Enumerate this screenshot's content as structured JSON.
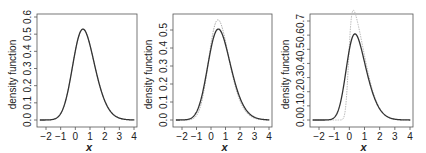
{
  "chart_data": [
    {
      "type": "line",
      "title": "",
      "xlabel": "x",
      "ylabel": "density function",
      "xlim": [
        -2.5,
        4.1
      ],
      "ylim": [
        0,
        0.6
      ],
      "x_ticks": [
        "-2",
        "-1",
        "0",
        "1",
        "2",
        "3",
        "4"
      ],
      "y_ticks": [
        "0.0",
        "0.1",
        "0.2",
        "0.3",
        "0.4",
        "0.5",
        "0.6"
      ],
      "grid": false,
      "legend": null,
      "series": [
        {
          "name": "fitted density",
          "color": "#333333",
          "style": "solid",
          "x": [
            -2.5,
            -1.5,
            -1.0,
            -0.5,
            0.0,
            0.3,
            0.5,
            0.7,
            1.0,
            1.5,
            2.0,
            2.5,
            3.0,
            4.0
          ],
          "values": [
            0.0,
            0.003,
            0.02,
            0.12,
            0.38,
            0.54,
            0.57,
            0.55,
            0.46,
            0.28,
            0.13,
            0.05,
            0.015,
            0.001
          ]
        },
        {
          "name": "true density",
          "color": "#aaaaaa",
          "style": "dotted",
          "x": [
            -2.5,
            -1.5,
            -1.0,
            -0.5,
            0.0,
            0.3,
            0.5,
            0.7,
            1.0,
            1.5,
            2.0,
            2.5,
            3.0,
            4.0
          ],
          "values": [
            0.0,
            0.003,
            0.02,
            0.12,
            0.38,
            0.54,
            0.57,
            0.55,
            0.46,
            0.28,
            0.13,
            0.05,
            0.015,
            0.001
          ]
        }
      ],
      "params": {
        "fit": {
          "loc": -0.05,
          "scale": 1.05,
          "shape": 1.6
        },
        "true": {
          "loc": -0.05,
          "scale": 1.05,
          "shape": 1.6
        },
        "ymax": 0.6
      }
    },
    {
      "type": "line",
      "title": "",
      "xlabel": "x",
      "ylabel": "density function",
      "xlim": [
        -2.5,
        4.1
      ],
      "ylim": [
        0,
        0.57
      ],
      "x_ticks": [
        "-2",
        "-1",
        "0",
        "1",
        "2",
        "3",
        "4"
      ],
      "y_ticks": [
        "0.0",
        "0.1",
        "0.2",
        "0.3",
        "0.4",
        "0.5"
      ],
      "grid": false,
      "legend": null,
      "series": [
        {
          "name": "fitted density",
          "color": "#333333",
          "style": "solid",
          "x": [
            -2.5,
            -1.5,
            -1.0,
            -0.5,
            0.0,
            0.3,
            0.5,
            0.7,
            1.0,
            1.5,
            2.0,
            2.5,
            3.0,
            4.0
          ],
          "values": [
            0.0,
            0.004,
            0.025,
            0.12,
            0.36,
            0.51,
            0.54,
            0.52,
            0.44,
            0.27,
            0.13,
            0.05,
            0.015,
            0.001
          ]
        },
        {
          "name": "true density",
          "color": "#aaaaaa",
          "style": "dotted",
          "x": [
            -2.5,
            -1.5,
            -1.0,
            -0.5,
            0.0,
            0.3,
            0.5,
            0.7,
            1.0,
            1.5,
            2.0,
            2.5,
            3.0,
            4.0
          ],
          "values": [
            0.0,
            0.003,
            0.02,
            0.11,
            0.37,
            0.54,
            0.57,
            0.54,
            0.44,
            0.26,
            0.12,
            0.045,
            0.013,
            0.001
          ]
        }
      ],
      "params": {
        "fit": {
          "loc": -0.1,
          "scale": 1.12,
          "shape": 1.7
        },
        "true": {
          "loc": -0.08,
          "scale": 1.05,
          "shape": 1.9
        },
        "ymax": 0.57
      }
    },
    {
      "type": "line",
      "title": "",
      "xlabel": "x",
      "ylabel": "density function",
      "xlim": [
        -2.5,
        4.1
      ],
      "ylim": [
        0,
        0.72
      ],
      "x_ticks": [
        "-2",
        "-1",
        "0",
        "1",
        "2",
        "3",
        "4"
      ],
      "y_ticks": [
        "0.0",
        "0.1",
        "0.2",
        "0.3",
        "0.4",
        "0.5",
        "0.6",
        "0.7"
      ],
      "grid": false,
      "legend": null,
      "series": [
        {
          "name": "fitted density",
          "color": "#333333",
          "style": "solid",
          "x": [
            -2.5,
            -1.5,
            -1.0,
            -0.5,
            0.0,
            0.3,
            0.5,
            0.7,
            1.0,
            1.5,
            2.0,
            2.5,
            3.0,
            4.0
          ],
          "values": [
            0.0,
            0.004,
            0.03,
            0.15,
            0.48,
            0.62,
            0.63,
            0.58,
            0.45,
            0.26,
            0.12,
            0.05,
            0.015,
            0.001
          ]
        },
        {
          "name": "true density",
          "color": "#bbbbbb",
          "style": "dotted",
          "x": [
            -2.5,
            -1.5,
            -1.0,
            -0.5,
            0.0,
            0.3,
            0.5,
            0.7,
            1.0,
            1.5,
            2.0,
            2.5,
            3.0,
            4.0
          ],
          "values": [
            0.0,
            0.0,
            0.005,
            0.08,
            0.55,
            0.7,
            0.66,
            0.56,
            0.42,
            0.24,
            0.11,
            0.045,
            0.014,
            0.001
          ]
        }
      ],
      "params": {
        "fit": {
          "loc": -0.15,
          "scale": 1.0,
          "shape": 2.2
        },
        "true": {
          "loc": -0.05,
          "scale": 0.95,
          "shape": 6.0
        },
        "ymax": 0.72
      }
    }
  ],
  "panels": [
    {
      "ylabel": "density function",
      "xlabel": "x"
    },
    {
      "ylabel": "density function",
      "xlabel": "x"
    },
    {
      "ylabel": "density function",
      "xlabel": "x"
    }
  ]
}
